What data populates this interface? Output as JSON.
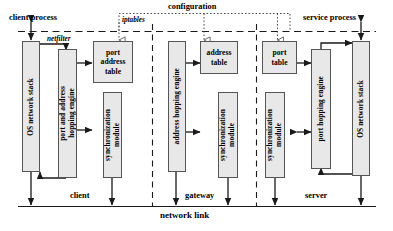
{
  "figure": {
    "title_top_left": "client process",
    "title_top_right": "service process",
    "config_bus_label": "configuration",
    "netfilter_label": "netfilter",
    "iptables_label": "iptables",
    "network_link_label": "network link",
    "zone_labels": {
      "left": "client",
      "middle": "gateway",
      "right": "server"
    }
  },
  "client_zone": {
    "os_stack": "OS network stack",
    "hopping_engine": "port and address\nhopping engine",
    "table": "port\naddress\ntable",
    "sync_module": "synchronization\nmodule"
  },
  "gateway_zone": {
    "hopping_engine": "address hopping engine",
    "table": "address\ntable",
    "sync_module": "synchronization\nmodule"
  },
  "server_zone": {
    "table": "port\ntable",
    "hopping_engine": "port hopping engine",
    "sync_module": "synchronization\nmodule",
    "os_stack": "OS network stack"
  },
  "colors": {
    "box_fill": "#e8e8e8",
    "box_stroke": "#555555",
    "line": "#1a1a1a",
    "background": "#ffffff"
  }
}
